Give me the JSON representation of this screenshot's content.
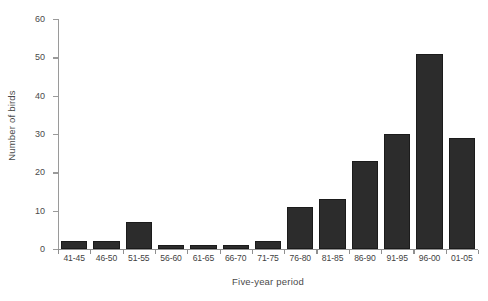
{
  "chart_data": {
    "type": "bar",
    "title": "",
    "xlabel": "Five-year period",
    "ylabel": "Number of birds",
    "categories": [
      "41-45",
      "46-50",
      "51-55",
      "56-60",
      "61-65",
      "66-70",
      "71-75",
      "76-80",
      "81-85",
      "86-90",
      "91-95",
      "96-00",
      "01-05"
    ],
    "values": [
      2,
      2,
      7,
      1,
      1,
      1,
      2,
      11,
      13,
      23,
      30,
      51,
      29
    ],
    "ylim": [
      0,
      60
    ],
    "yticks": [
      0,
      10,
      20,
      30,
      40,
      50,
      60
    ],
    "ytick_labels": [
      "0",
      "10",
      "20",
      "30",
      "40",
      "50",
      "60"
    ],
    "grid": false,
    "legend": false,
    "bar_color": "#2c2c2c",
    "axis_color": "#8f8f8f",
    "text_color": "#4a4a4a"
  }
}
